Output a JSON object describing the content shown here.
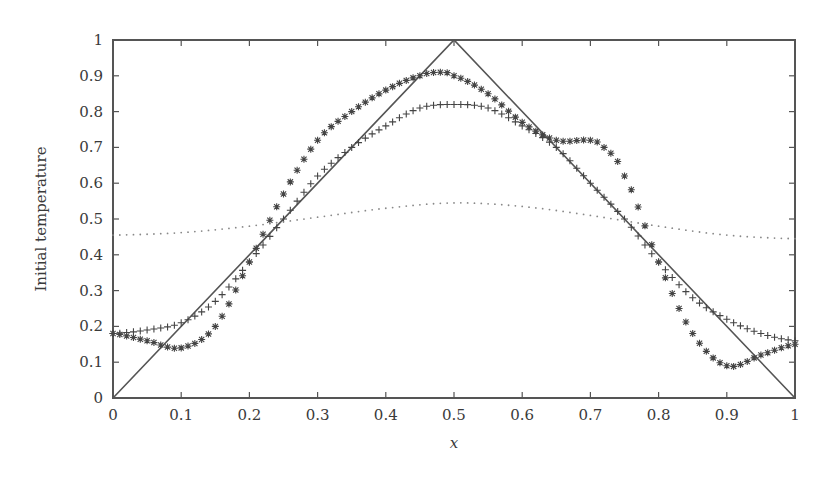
{
  "chart_data": {
    "type": "line",
    "title": "",
    "xlabel": "x",
    "ylabel": "Initial temperature",
    "xlim": [
      0,
      1
    ],
    "ylim": [
      0,
      1
    ],
    "grid": false,
    "legend": null,
    "xticks": [
      "0",
      "0.1",
      "0.2",
      "0.3",
      "0.4",
      "0.5",
      "0.6",
      "0.7",
      "0.8",
      "0.9",
      "1"
    ],
    "yticks": [
      "0",
      "0.1",
      "0.2",
      "0.3",
      "0.4",
      "0.5",
      "0.6",
      "0.7",
      "0.8",
      "0.9",
      "1"
    ],
    "series": [
      {
        "name": "exact triangle initial temperature",
        "style": "solid-line",
        "x": [
          0,
          0.5,
          1
        ],
        "y": [
          0,
          1,
          0
        ]
      },
      {
        "name": "approximation (plus markers)",
        "style": "plus-markers",
        "x": [
          0,
          0.05,
          0.1,
          0.15,
          0.2,
          0.25,
          0.3,
          0.35,
          0.4,
          0.45,
          0.5,
          0.55,
          0.6,
          0.65,
          0.7,
          0.75,
          0.8,
          0.85,
          0.9,
          0.95,
          1
        ],
        "y": [
          0.18,
          0.19,
          0.21,
          0.27,
          0.38,
          0.5,
          0.62,
          0.7,
          0.76,
          0.81,
          0.82,
          0.81,
          0.76,
          0.7,
          0.6,
          0.5,
          0.38,
          0.28,
          0.22,
          0.18,
          0.16
        ]
      },
      {
        "name": "approximation (star markers)",
        "style": "star-markers",
        "x": [
          0,
          0.05,
          0.1,
          0.15,
          0.2,
          0.25,
          0.3,
          0.35,
          0.4,
          0.45,
          0.48,
          0.5,
          0.55,
          0.6,
          0.65,
          0.7,
          0.72,
          0.75,
          0.8,
          0.85,
          0.9,
          0.95,
          1
        ],
        "y": [
          0.18,
          0.16,
          0.14,
          0.2,
          0.38,
          0.57,
          0.72,
          0.8,
          0.86,
          0.9,
          0.91,
          0.9,
          0.85,
          0.77,
          0.72,
          0.72,
          0.7,
          0.62,
          0.38,
          0.18,
          0.09,
          0.12,
          0.15
        ]
      },
      {
        "name": "approximation (dotted)",
        "style": "dotted-line",
        "x": [
          0,
          0.1,
          0.2,
          0.3,
          0.4,
          0.5,
          0.6,
          0.7,
          0.8,
          0.9,
          1
        ],
        "y": [
          0.455,
          0.462,
          0.48,
          0.505,
          0.53,
          0.545,
          0.535,
          0.51,
          0.48,
          0.455,
          0.445
        ]
      }
    ]
  },
  "axes": {
    "xlabel": "x",
    "ylabel": "Initial temperature"
  },
  "colors": {
    "line": "#555555",
    "markers": "#444444",
    "dotted": "#888888",
    "axis": "#555555"
  }
}
